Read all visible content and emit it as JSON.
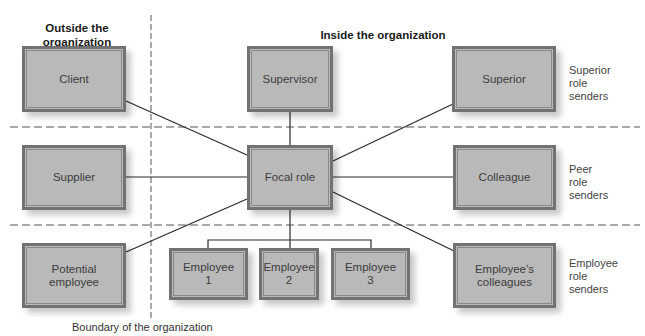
{
  "headings": {
    "outside": "Outside the\norganization",
    "inside": "Inside the organization"
  },
  "boxes": {
    "client": "Client",
    "supervisor": "Supervisor",
    "superior": "Superior",
    "supplier": "Supplier",
    "focal_role": "Focal role",
    "colleague": "Colleague",
    "potential_employee": "Potential\nemployee",
    "employee_1": "Employee\n1",
    "employee_2": "Employee\n2",
    "employee_3": "Employee\n3",
    "employees_colleagues": "Employee’s\ncolleagues"
  },
  "side_labels": {
    "superior": "Superior\nrole\nsenders",
    "peer": "Peer\nrole\nsenders",
    "employee": "Employee\nrole\nsenders"
  },
  "caption": "Boundary of the organization",
  "colors": {
    "box_fill": "#b9b9b9",
    "box_border": "#727272",
    "line": "#2a2a2a",
    "dashed": "#555555"
  }
}
